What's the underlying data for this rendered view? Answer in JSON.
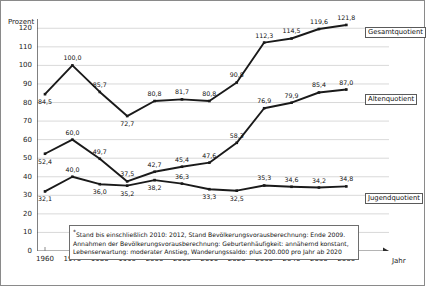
{
  "chart_data": {
    "type": "line",
    "title": "",
    "xlabel": "Jahr",
    "ylabel": "Prozent",
    "ylim": [
      0,
      125
    ],
    "y_ticks": [
      0,
      10,
      20,
      30,
      40,
      50,
      60,
      70,
      80,
      90,
      100,
      110,
      120
    ],
    "grid": true,
    "legend_position": "right-inline",
    "categories": [
      "1960",
      "1970",
      "1980",
      "1990",
      "2000",
      "2005",
      "2010",
      "2020",
      "2030",
      "2040",
      "2050",
      "2060"
    ],
    "series": [
      {
        "name": "Gesamtquotient",
        "values": [
          84.5,
          100.0,
          85.7,
          72.7,
          80.8,
          81.7,
          80.8,
          90.8,
          112.3,
          114.5,
          119.6,
          121.8
        ],
        "labels": [
          "84,5",
          "100,0",
          "85,7",
          "72,7",
          "80,8",
          "81,7",
          "80,8",
          "90,8",
          "112,3",
          "114,5",
          "119,6",
          "121,8"
        ],
        "color": "#1a1a1a"
      },
      {
        "name": "Altenquotient",
        "values": [
          52.4,
          60.0,
          49.7,
          37.5,
          42.7,
          45.4,
          47.6,
          58.3,
          76.9,
          79.9,
          85.4,
          87.0
        ],
        "labels": [
          "52,4",
          "60,0",
          "49,7",
          "37,5",
          "42,7",
          "45,4",
          "47,6",
          "58,3",
          "76,9",
          "79,9",
          "85,4",
          "87,0"
        ],
        "color": "#1a1a1a"
      },
      {
        "name": "Jugendquotient",
        "values": [
          32.1,
          40.0,
          36.0,
          35.2,
          38.2,
          36.3,
          33.3,
          32.5,
          35.3,
          34.6,
          34.2,
          34.8
        ],
        "labels": [
          "32,1",
          "40,0",
          "36,0",
          "35,2",
          "38,2",
          "36,3",
          "33,3",
          "32,5",
          "35,3",
          "34,6",
          "34,2",
          "34,8"
        ],
        "color": "#1a1a1a"
      }
    ]
  },
  "legend": {
    "gesamtquotient": "Gesamtquotient",
    "altenquotient": "Altenquotient",
    "jugendquotient": "Jugendquotient"
  },
  "note": {
    "marker": "*",
    "line1": "Stand bis einschließlich 2010: 2012, Stand Bevölkerungsvorausberechnung: Ende 2009.",
    "line2": "Annahmen der Bevölkerungsvorausberechnung: Geburtenhäufigkeit: annähernd konstant,",
    "line3": "Lebenserwartung: moderater Anstieg, Wanderungssaldo: plus 200.000 pro Jahr ab 2020"
  },
  "axes": {
    "y_title": "Prozent",
    "x_title": "Jahr"
  }
}
